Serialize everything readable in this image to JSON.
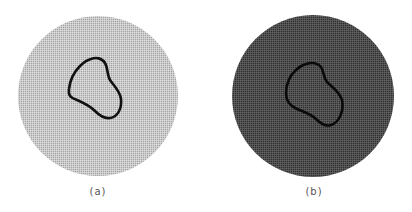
{
  "figure": {
    "panels": [
      {
        "id": "a",
        "label": "(a)",
        "background": "#ffffff",
        "disk_fill": "#a6a6a6",
        "grid_color": "#e6e6e6",
        "contour_color": "#111111"
      },
      {
        "id": "b",
        "label": "(b)",
        "background": "#ffffff",
        "disk_fill": "#333333",
        "grid_color": "#707070",
        "contour_color": "#0a0a0a"
      }
    ]
  }
}
